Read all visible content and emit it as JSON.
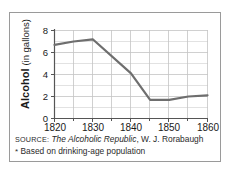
{
  "chart_data": {
    "type": "line",
    "title": "",
    "xlabel": "",
    "ylabel": "Alcohol (in gallons)",
    "ylabel_bold_part": "Alcohol",
    "ylabel_light_part": "(in gallons)",
    "x": [
      1820,
      1825,
      1830,
      1840,
      1845,
      1850,
      1855,
      1860
    ],
    "values": [
      6.7,
      7.0,
      7.2,
      4.1,
      1.7,
      1.7,
      2.0,
      2.1
    ],
    "series": [
      {
        "name": "Alcohol consumption per capita",
        "values": [
          6.7,
          7.0,
          7.2,
          4.1,
          1.7,
          1.7,
          2.0,
          2.1
        ]
      }
    ],
    "xlim": [
      1818,
      1862
    ],
    "ylim": [
      0,
      8
    ],
    "xticks": [
      1820,
      1830,
      1840,
      1850,
      1860
    ],
    "xticklabels": [
      "1820",
      "1830",
      "1840",
      "1850",
      "1860"
    ],
    "yticks": [
      0,
      2,
      4,
      6,
      8
    ],
    "yticklabels": [
      "0",
      "2",
      "4",
      "6",
      "8"
    ],
    "minor_xticks": [
      1825,
      1835,
      1845,
      1855
    ],
    "minor_yticks": [
      1,
      3,
      5,
      7
    ],
    "grid": true,
    "legend": "none",
    "line_color": "#6e6e6e",
    "grid_color": "#c9c9c9",
    "axis_color": "#555555"
  },
  "notes": {
    "source_prefix": "SOURCE:",
    "source_title": "The Alcoholic Republic",
    "source_author": ", W. J. Rorabaugh",
    "footnote_marker": "*",
    "footnote_text": "Based on drinking-age population"
  },
  "colors": {
    "line": "#6e6e6e",
    "grid": "#c9c9c9",
    "frame": "#9a9a9a",
    "text": "#1a1a1a",
    "background": "#ffffff"
  }
}
